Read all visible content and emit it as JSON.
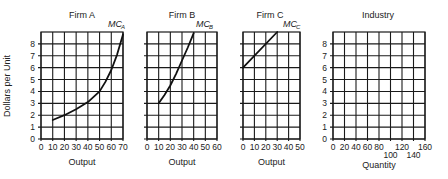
{
  "figure": {
    "y_axis_label": "Dollars per Unit"
  },
  "chart_data": [
    {
      "type": "line",
      "id": "firmA",
      "title": "Firm A",
      "xlabel": "Output",
      "ylabel": "Dollars per Unit",
      "xlim": [
        0,
        70
      ],
      "ylim": [
        0,
        9
      ],
      "x_ticks": [
        0,
        10,
        20,
        30,
        40,
        50,
        60,
        70
      ],
      "y_ticks": [
        0,
        1,
        2,
        3,
        4,
        5,
        6,
        7,
        8
      ],
      "show_y_tick_labels": true,
      "grid": true,
      "series": [
        {
          "name": "MC",
          "subscript": "A",
          "x": [
            10,
            20,
            30,
            40,
            50,
            55,
            60,
            65,
            70
          ],
          "y": [
            1.6,
            2.0,
            2.5,
            3.1,
            4.0,
            4.8,
            5.8,
            7.1,
            8.8
          ]
        }
      ]
    },
    {
      "type": "line",
      "id": "firmB",
      "title": "Firm B",
      "xlabel": "Output",
      "xlim": [
        0,
        60
      ],
      "ylim": [
        0,
        9
      ],
      "x_ticks": [
        0,
        10,
        20,
        30,
        40,
        50,
        60
      ],
      "y_ticks": [
        0,
        1,
        2,
        3,
        4,
        5,
        6,
        7,
        8
      ],
      "show_y_tick_labels": false,
      "grid": true,
      "series": [
        {
          "name": "MC",
          "subscript": "B",
          "x": [
            10,
            15,
            20,
            25,
            30,
            35,
            40
          ],
          "y": [
            3.0,
            3.7,
            4.5,
            5.5,
            6.6,
            7.7,
            8.9
          ]
        }
      ]
    },
    {
      "type": "line",
      "id": "firmC",
      "title": "Firm C",
      "xlabel": "Output",
      "xlim": [
        0,
        50
      ],
      "ylim": [
        0,
        9
      ],
      "x_ticks": [
        0,
        10,
        20,
        30,
        40,
        50
      ],
      "y_ticks": [
        0,
        1,
        2,
        3,
        4,
        5,
        6,
        7,
        8
      ],
      "show_y_tick_labels": false,
      "grid": true,
      "series": [
        {
          "name": "MC",
          "subscript": "C",
          "x": [
            0,
            30
          ],
          "y": [
            6,
            9
          ]
        }
      ]
    },
    {
      "type": "line",
      "id": "industry",
      "title": "Industry",
      "xlabel": "Quantity",
      "xlim": [
        0,
        160
      ],
      "ylim": [
        0,
        9
      ],
      "x_ticks": [
        0,
        20,
        40,
        60,
        80,
        100,
        120,
        140,
        160
      ],
      "x_ticks_staggered": [
        100,
        140
      ],
      "y_ticks": [
        0,
        1,
        2,
        3,
        4,
        5,
        6,
        7,
        8
      ],
      "show_y_tick_labels": true,
      "grid": true,
      "series": []
    }
  ]
}
